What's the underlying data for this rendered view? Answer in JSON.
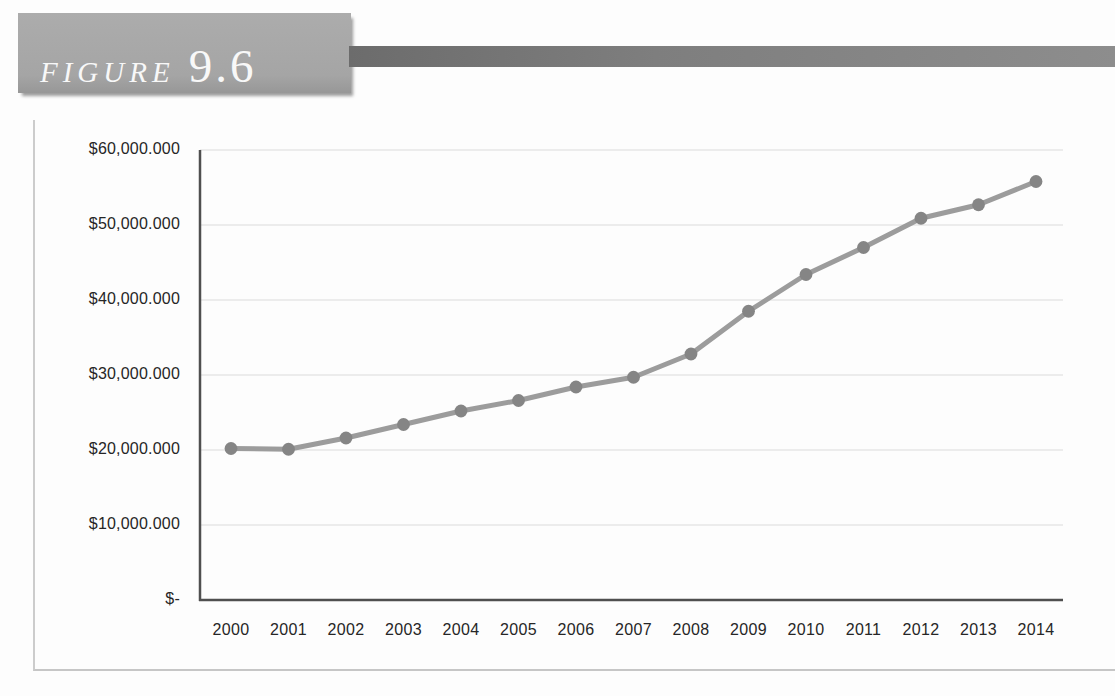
{
  "figure_label": {
    "prefix": "FIGURE",
    "number": "9.6"
  },
  "colors": {
    "header_box": "#a7a7a7",
    "header_bar": "#7e7e7e",
    "header_text": "#f8f8f8",
    "frame_border": "#c9c9c9",
    "grid": "#dcdcdc",
    "axis": "#4f4f4f",
    "line": "#9c9c9c",
    "marker": "#858585",
    "tick_text": "#262626"
  },
  "chart_data": {
    "type": "line",
    "title": "",
    "xlabel": "",
    "ylabel": "",
    "grid": true,
    "legend": false,
    "marker": "circle",
    "ylim": [
      0,
      60000000
    ],
    "categories": [
      "2000",
      "2001",
      "2002",
      "2003",
      "2004",
      "2005",
      "2006",
      "2007",
      "2008",
      "2009",
      "2010",
      "2011",
      "2012",
      "2013",
      "2014"
    ],
    "series": [
      {
        "name": "Value",
        "values": [
          20200000,
          20100000,
          21600000,
          23400000,
          25200000,
          26600000,
          28400000,
          29700000,
          32800000,
          38500000,
          43400000,
          47000000,
          50900000,
          52700000,
          55800000
        ]
      }
    ],
    "y_ticks": [
      {
        "label": "$-",
        "value": 0
      },
      {
        "label": "$10,000.000",
        "value": 10000000
      },
      {
        "label": "$20,000.000",
        "value": 20000000
      },
      {
        "label": "$30,000.000",
        "value": 30000000
      },
      {
        "label": "$40,000.000",
        "value": 40000000
      },
      {
        "label": "$50,000.000",
        "value": 50000000
      },
      {
        "label": "$60,000.000",
        "value": 60000000
      }
    ]
  }
}
